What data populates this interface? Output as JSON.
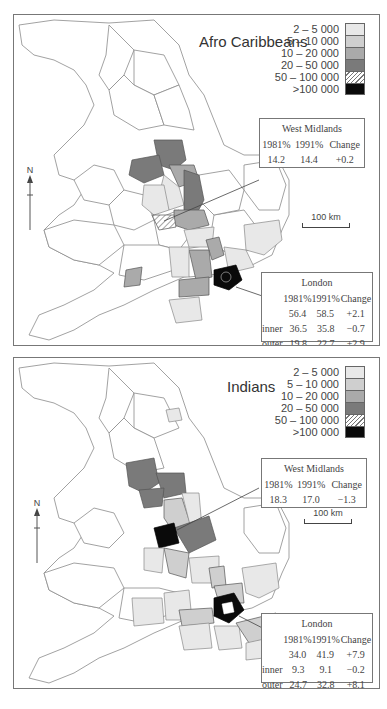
{
  "colors": {
    "c2_5k": "#e8e8e8",
    "c5_10k": "#cfcfcf",
    "c10_20k": "#aaaaaa",
    "c20_50k": "#7a7a7a",
    "c100k": "#0a0a0a",
    "outline": "#8a8a8a"
  },
  "legend": {
    "items": [
      {
        "label": "2 – 5 000",
        "class": "c2_5k"
      },
      {
        "label": "5 – 10 000",
        "class": "c5_10k"
      },
      {
        "label": "10 – 20 000",
        "class": "c10_20k"
      },
      {
        "label": "20 – 50 000",
        "class": "c20_50k"
      },
      {
        "label": "50 – 100 000",
        "class": "hatch"
      },
      {
        "label": ">100 000",
        "class": "c100k"
      }
    ]
  },
  "maps": [
    {
      "title": "Afro Caribbeans",
      "north_label": "N",
      "scale_label": "100 km",
      "west_midlands": {
        "title": "West Midlands",
        "headers": [
          "1981%",
          "1991%",
          "Change"
        ],
        "values": [
          "14.2",
          "14.4",
          "+0.2"
        ]
      },
      "london": {
        "title": "London",
        "headers": [
          "",
          "1981%",
          "1991%",
          "Change"
        ],
        "rows": [
          [
            "",
            "56.4",
            "58.5",
            "+2.1"
          ],
          [
            "inner",
            "36.5",
            "35.8",
            "−0.7"
          ],
          [
            "outer",
            "19.8",
            "22.7",
            "+2.9"
          ]
        ]
      }
    },
    {
      "title": "Indians",
      "north_label": "N",
      "scale_label": "100 km",
      "west_midlands": {
        "title": "West Midlands",
        "headers": [
          "1981%",
          "1991%",
          "Change"
        ],
        "values": [
          "18.3",
          "17.0",
          "−1.3"
        ]
      },
      "london": {
        "title": "London",
        "headers": [
          "",
          "1981%",
          "1991%",
          "Change"
        ],
        "rows": [
          [
            "",
            "34.0",
            "41.9",
            "+7.9"
          ],
          [
            "inner",
            "9.3",
            "9.1",
            "−0.2"
          ],
          [
            "outer",
            "24.7",
            "32.8",
            "+8.1"
          ]
        ]
      }
    }
  ]
}
